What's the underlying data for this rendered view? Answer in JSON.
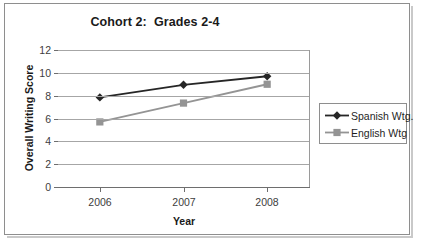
{
  "chart_data": {
    "type": "line",
    "title": "Cohort 2:  Grades 2-4",
    "xlabel": "Year",
    "ylabel": "Overall Writing Score",
    "categories": [
      "2006",
      "2007",
      "2008"
    ],
    "x": [
      2006,
      2007,
      2008
    ],
    "series": [
      {
        "name": "Spanish Wtg.",
        "values": [
          7.85,
          8.95,
          9.7
        ],
        "color": "#262626",
        "marker": "diamond"
      },
      {
        "name": "English Wtg",
        "values": [
          5.7,
          7.35,
          9.0
        ],
        "color": "#949494",
        "marker": "square"
      }
    ],
    "ylim": [
      0,
      12
    ],
    "ytick_values": [
      12,
      10,
      8,
      6,
      4,
      2,
      0
    ],
    "ytick_labels": [
      "12",
      "10",
      "8",
      "6",
      "4",
      "2",
      "0"
    ],
    "ystep": 2,
    "grid": "horizontal",
    "legend_position": "right",
    "legend_entries": [
      "Spanish Wtg.",
      "English Wtg"
    ],
    "background_color": "#ffffff",
    "gridline_color": "#a6a6a6",
    "axis_color": "#6e6e6e",
    "frame_color": "#8e8e8e"
  }
}
